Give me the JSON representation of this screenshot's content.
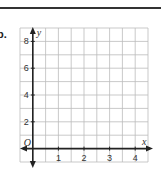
{
  "problem": {
    "label": "b."
  },
  "chart_data": {
    "type": "scatter",
    "title": "",
    "xlabel": "x",
    "ylabel": "y",
    "origin_label": "O",
    "xlim": [
      -0.5,
      4.5
    ],
    "ylim": [
      -1,
      9
    ],
    "x_ticks": [
      1,
      2,
      3,
      4
    ],
    "x_tick_labels": [
      "1",
      "2",
      "3",
      "4"
    ],
    "y_ticks": [
      2,
      4,
      6,
      8
    ],
    "y_tick_labels": [
      "2",
      "4",
      "6",
      "8"
    ],
    "x_grid_step": 0.5,
    "y_grid_step": 1,
    "grid": true,
    "series": [],
    "colors": {
      "axis": "#222222",
      "grid": "#bbbbbb",
      "text": "#333333"
    }
  }
}
